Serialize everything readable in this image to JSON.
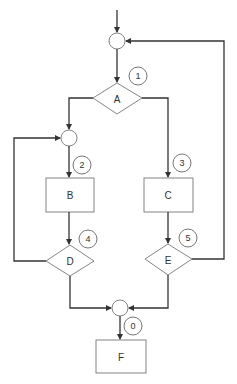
{
  "diagram": {
    "type": "flowchart",
    "colors": {
      "line": "#333333",
      "shape_border": "#777777",
      "background": "#ffffff"
    },
    "nodes": {
      "A": {
        "label": "A",
        "shape": "diamond"
      },
      "B": {
        "label": "B",
        "shape": "rectangle"
      },
      "C": {
        "label": "C",
        "shape": "rectangle"
      },
      "D": {
        "label": "D",
        "shape": "diamond"
      },
      "E": {
        "label": "E",
        "shape": "diamond"
      },
      "F": {
        "label": "F",
        "shape": "rectangle"
      }
    },
    "junctions": [
      "top-junction",
      "left-junction",
      "bottom-junction"
    ],
    "edge_labels": {
      "l0": "0",
      "l1": "1",
      "l2": "2",
      "l3": "3",
      "l4": "4",
      "l5": "5"
    },
    "edges": [
      {
        "from": "entry",
        "to": "top-junction"
      },
      {
        "from": "top-junction",
        "to": "A",
        "label": "1"
      },
      {
        "from": "A",
        "to": "left-junction"
      },
      {
        "from": "A",
        "to": "C",
        "label": "3"
      },
      {
        "from": "left-junction",
        "to": "B",
        "label": "2"
      },
      {
        "from": "B",
        "to": "D",
        "label": "4"
      },
      {
        "from": "D",
        "to": "left-junction"
      },
      {
        "from": "D",
        "to": "bottom-junction"
      },
      {
        "from": "C",
        "to": "E",
        "label": "5"
      },
      {
        "from": "E",
        "to": "top-junction"
      },
      {
        "from": "E",
        "to": "bottom-junction"
      },
      {
        "from": "bottom-junction",
        "to": "F",
        "label": "0"
      }
    ]
  }
}
